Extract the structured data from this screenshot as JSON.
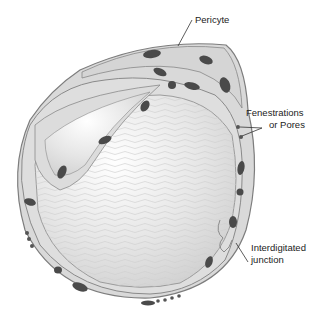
{
  "diagram": {
    "labels": {
      "pericyte": "Pericyte",
      "fenestrations_line1": "Fenestrations",
      "fenestrations_line2": "or Pores",
      "junction_line1": "Interdigitated",
      "junction_line2": "junction"
    },
    "colors": {
      "membrane": "#8a8a8a",
      "cytoplasm": "#dcdcdc",
      "lumen": "#ececec",
      "nucleus": "#4a4a4a",
      "leader_line": "#333333"
    }
  }
}
